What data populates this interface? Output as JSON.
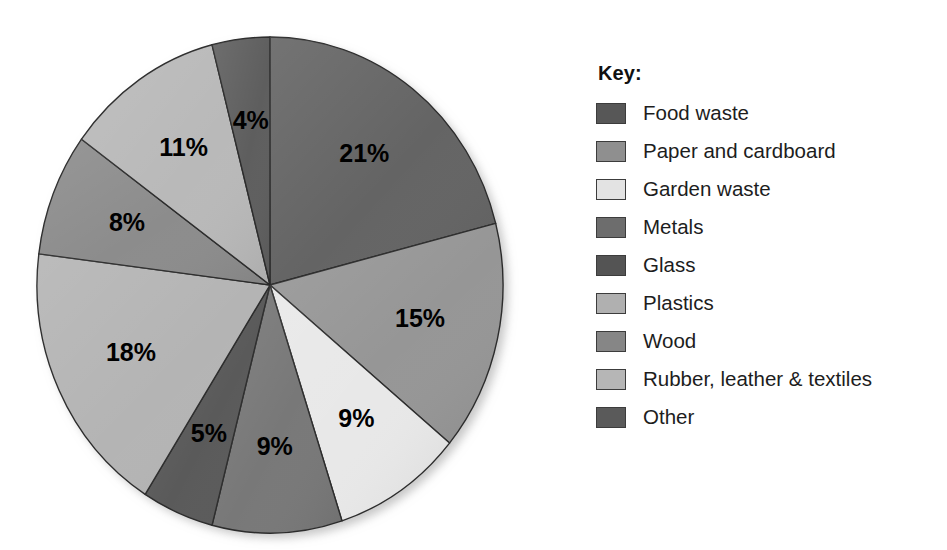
{
  "legend": {
    "title": "Key:",
    "items": [
      {
        "label": "Food waste",
        "color": "#575757"
      },
      {
        "label": "Paper and cardboard",
        "color": "#8f8f8f"
      },
      {
        "label": "Garden waste",
        "color": "#e3e3e3"
      },
      {
        "label": "Metals",
        "color": "#6d6d6d"
      },
      {
        "label": "Glass",
        "color": "#545454"
      },
      {
        "label": "Plastics",
        "color": "#b0b0b0"
      },
      {
        "label": "Wood",
        "color": "#868686"
      },
      {
        "label": "Rubber, leather & textiles",
        "color": "#b6b6b6"
      },
      {
        "label": "Other",
        "color": "#5a5a5a"
      }
    ]
  },
  "chart_data": {
    "type": "pie",
    "title": "",
    "start_angle_deg": 0,
    "direction": "clockwise",
    "legend_position": "right",
    "value_suffix": "%",
    "total": 100,
    "categories": [
      "Food waste",
      "Paper and cardboard",
      "Garden waste",
      "Metals",
      "Glass",
      "Plastics",
      "Wood",
      "Rubber, leather & textiles",
      "Other"
    ],
    "values": [
      21,
      15,
      9,
      9,
      5,
      18,
      8,
      11,
      4
    ],
    "labels": [
      "21%",
      "15%",
      "9%",
      "9%",
      "5%",
      "18%",
      "8%",
      "11%",
      "4%"
    ],
    "colors": [
      "#646464",
      "#969696",
      "#e8e8e8",
      "#787878",
      "#5a5a5a",
      "#b4b4b4",
      "#8c8c8c",
      "#b9b9b9",
      "#5e5e5e"
    ],
    "slices": [
      {
        "name": "Food waste",
        "value": 21,
        "label": "21%",
        "color": "#646464"
      },
      {
        "name": "Paper and cardboard",
        "value": 15,
        "label": "15%",
        "color": "#969696"
      },
      {
        "name": "Garden waste",
        "value": 9,
        "label": "9%",
        "color": "#e8e8e8"
      },
      {
        "name": "Metals",
        "value": 9,
        "label": "9%",
        "color": "#787878"
      },
      {
        "name": "Glass",
        "value": 5,
        "label": "5%",
        "color": "#5a5a5a"
      },
      {
        "name": "Plastics",
        "value": 18,
        "label": "18%",
        "color": "#b4b4b4"
      },
      {
        "name": "Wood",
        "value": 8,
        "label": "8%",
        "color": "#8c8c8c"
      },
      {
        "name": "Rubber, leather & textiles",
        "value": 11,
        "label": "11%",
        "color": "#b9b9b9"
      },
      {
        "name": "Other",
        "value": 4,
        "label": "4%",
        "color": "#5e5e5e"
      }
    ],
    "geometry": {
      "center_x": 270,
      "center_y": 285,
      "radius_x": 233,
      "radius_y": 248,
      "label_radius_factor": 0.66,
      "stroke": "#2b2b2b",
      "stroke_width": 1.4
    }
  }
}
